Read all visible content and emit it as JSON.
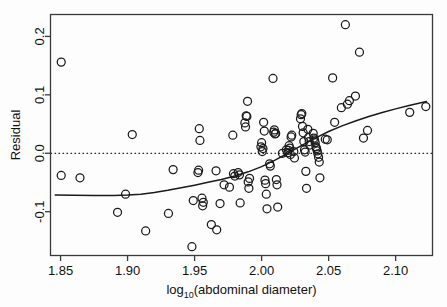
{
  "chart_data": {
    "type": "scatter",
    "title": "",
    "xlabel": "log10(abdominal diameter)",
    "xlabel_base": "log",
    "xlabel_sub": "10",
    "xlabel_rest": "(abdominal diameter)",
    "ylabel": "Residual",
    "xlim": [
      1.8425,
      2.1275
    ],
    "ylim": [
      -0.175,
      0.2375
    ],
    "xticks": [
      1.85,
      1.9,
      1.95,
      2.0,
      2.05,
      2.1
    ],
    "xticklabels": [
      "1.85",
      "1.90",
      "1.95",
      "2.00",
      "2.05",
      "2.10"
    ],
    "yticks": [
      -0.1,
      0.0,
      0.1,
      0.2
    ],
    "yticklabels": [
      "-0.1",
      "0.0",
      "0.1",
      "0.2"
    ],
    "grid": false,
    "legend": "none",
    "marker": "open-circle",
    "marker_size": 4,
    "point_color": "#1a1a1a",
    "line_color": "#1a1a1a",
    "reference_line": {
      "type": "horizontal-dotted",
      "y": 0.0,
      "style": "dotted"
    },
    "series": [
      {
        "name": "residuals",
        "type": "scatter",
        "points": [
          [
            1.8505,
            0.156
          ],
          [
            1.8505,
            -0.038
          ],
          [
            1.8645,
            -0.042
          ],
          [
            1.8925,
            -0.101
          ],
          [
            1.8985,
            -0.07
          ],
          [
            1.9035,
            0.032
          ],
          [
            1.9135,
            -0.133
          ],
          [
            1.9305,
            -0.103
          ],
          [
            1.934,
            -0.028
          ],
          [
            1.948,
            -0.16
          ],
          [
            1.949,
            -0.081
          ],
          [
            1.9525,
            -0.033
          ],
          [
            1.953,
            -0.029
          ],
          [
            1.9535,
            0.042
          ],
          [
            1.954,
            0.022
          ],
          [
            1.9555,
            -0.077
          ],
          [
            1.956,
            -0.09
          ],
          [
            1.9565,
            -0.084
          ],
          [
            1.9625,
            -0.122
          ],
          [
            1.966,
            -0.03
          ],
          [
            1.9665,
            -0.131
          ],
          [
            1.969,
            -0.086
          ],
          [
            1.972,
            -0.054
          ],
          [
            1.976,
            -0.058
          ],
          [
            1.9785,
            0.031
          ],
          [
            1.979,
            -0.035
          ],
          [
            1.98,
            -0.039
          ],
          [
            1.9825,
            -0.033
          ],
          [
            1.9835,
            -0.037
          ],
          [
            1.984,
            -0.085
          ],
          [
            1.9875,
            0.052
          ],
          [
            1.988,
            0.045
          ],
          [
            1.9885,
            0.064
          ],
          [
            1.989,
            0.063
          ],
          [
            1.9895,
            0.089
          ],
          [
            1.99,
            -0.049
          ],
          [
            1.9905,
            -0.06
          ],
          [
            1.991,
            -0.043
          ],
          [
            1.9995,
            0.011
          ],
          [
            2.0,
            0.018
          ],
          [
            2.0005,
            0.003
          ],
          [
            2.001,
            0.008
          ],
          [
            2.0015,
            0.053
          ],
          [
            2.002,
            0.038
          ],
          [
            2.0025,
            -0.046
          ],
          [
            2.003,
            -0.052
          ],
          [
            2.0035,
            -0.07
          ],
          [
            2.004,
            -0.095
          ],
          [
            2.006,
            -0.018
          ],
          [
            2.0065,
            -0.022
          ],
          [
            2.0085,
            0.128
          ],
          [
            2.009,
            0.036
          ],
          [
            2.0095,
            0.04
          ],
          [
            2.01,
            0.033
          ],
          [
            2.0105,
            0.034
          ],
          [
            2.011,
            -0.045
          ],
          [
            2.0115,
            -0.054
          ],
          [
            2.012,
            -0.092
          ],
          [
            2.0155,
            0.0
          ],
          [
            2.0185,
            0.006
          ],
          [
            2.0195,
            0.001
          ],
          [
            2.02,
            0.005
          ],
          [
            2.0205,
            0.013
          ],
          [
            2.021,
            0.009
          ],
          [
            2.0215,
            -0.002
          ],
          [
            2.022,
            0.028
          ],
          [
            2.0225,
            0.031
          ],
          [
            2.024,
            0.003
          ],
          [
            2.0245,
            -0.008
          ],
          [
            2.029,
            0.059
          ],
          [
            2.0295,
            0.066
          ],
          [
            2.03,
            0.068
          ],
          [
            2.0305,
            0.046
          ],
          [
            2.031,
            0.035
          ],
          [
            2.0315,
            0.02
          ],
          [
            2.032,
            0.006
          ],
          [
            2.0325,
            0.002
          ],
          [
            2.033,
            -0.031
          ],
          [
            2.0335,
            -0.06
          ],
          [
            2.0345,
            0.041
          ],
          [
            2.035,
            0.027
          ],
          [
            2.0355,
            0.02
          ],
          [
            2.036,
            0.014
          ],
          [
            2.0385,
            0.034
          ],
          [
            2.039,
            0.026
          ],
          [
            2.0395,
            0.023
          ],
          [
            2.04,
            0.018
          ],
          [
            2.0405,
            0.011
          ],
          [
            2.041,
            0.008
          ],
          [
            2.0415,
            0.004
          ],
          [
            2.042,
            -0.001
          ],
          [
            2.0425,
            -0.007
          ],
          [
            2.043,
            -0.015
          ],
          [
            2.0435,
            -0.042
          ],
          [
            2.0475,
            0.024
          ],
          [
            2.049,
            0.023
          ],
          [
            2.053,
            0.129
          ],
          [
            2.0545,
            0.053
          ],
          [
            2.0595,
            0.078
          ],
          [
            2.0625,
            0.22
          ],
          [
            2.064,
            0.084
          ],
          [
            2.0655,
            0.09
          ],
          [
            2.07,
            0.098
          ],
          [
            2.073,
            0.173
          ],
          [
            2.076,
            0.026
          ],
          [
            2.079,
            0.039
          ],
          [
            2.1105,
            0.07
          ],
          [
            2.1225,
            0.08
          ]
        ]
      },
      {
        "name": "loess-smooth",
        "type": "line",
        "points": [
          [
            1.846,
            -0.0715
          ],
          [
            1.86,
            -0.0718
          ],
          [
            1.875,
            -0.0722
          ],
          [
            1.89,
            -0.0722
          ],
          [
            1.9,
            -0.0715
          ],
          [
            1.91,
            -0.07
          ],
          [
            1.92,
            -0.0672
          ],
          [
            1.93,
            -0.0635
          ],
          [
            1.94,
            -0.0592
          ],
          [
            1.95,
            -0.0546
          ],
          [
            1.96,
            -0.0498
          ],
          [
            1.97,
            -0.0448
          ],
          [
            1.98,
            -0.039
          ],
          [
            1.99,
            -0.0318
          ],
          [
            2.0,
            -0.0228
          ],
          [
            2.01,
            -0.0118
          ],
          [
            2.02,
            0.0005
          ],
          [
            2.03,
            0.0135
          ],
          [
            2.04,
            0.026
          ],
          [
            2.05,
            0.0372
          ],
          [
            2.06,
            0.0468
          ],
          [
            2.07,
            0.0552
          ],
          [
            2.08,
            0.0628
          ],
          [
            2.09,
            0.0698
          ],
          [
            2.1,
            0.076
          ],
          [
            2.11,
            0.0818
          ],
          [
            2.123,
            0.0885
          ]
        ]
      }
    ]
  }
}
